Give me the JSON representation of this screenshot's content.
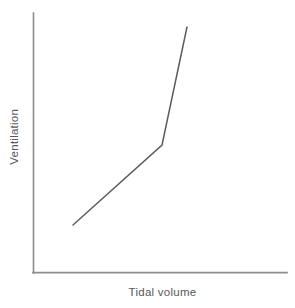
{
  "chart_data": {
    "type": "line",
    "title": "",
    "subtitle": "",
    "xlabel": "Tidal volume",
    "ylabel": "Ventilation",
    "series": [
      {
        "name": "Ventilation vs tidal volume",
        "x": [
          0.17,
          0.51,
          0.61
        ],
        "y": [
          0.18,
          0.49,
          0.95
        ],
        "points_px": [
          [
            73,
            225
          ],
          [
            162,
            145
          ],
          [
            187,
            27
          ]
        ],
        "color": "#5d5d5d",
        "line_width": 1.5,
        "shape": "piecewise-linear-two-segment",
        "description": "Gentle near-linear rise followed by a steep upward inflection"
      }
    ],
    "xlim": [
      0,
      1
    ],
    "ylim": [
      0,
      1
    ],
    "x_ticks": [],
    "y_ticks": [],
    "x_tick_labels": [],
    "y_tick_labels": [],
    "grid": false,
    "legend": false,
    "legend_position": "none",
    "annotations": [],
    "axis_color": "#8d8d8d",
    "label_color": "#58585a",
    "background_color": "#ffffff",
    "axes_style": "open-left-bottom-spines-only"
  },
  "figure": {
    "x_axis_name": "Tidal volume",
    "y_axis_name": "Ventilation"
  }
}
